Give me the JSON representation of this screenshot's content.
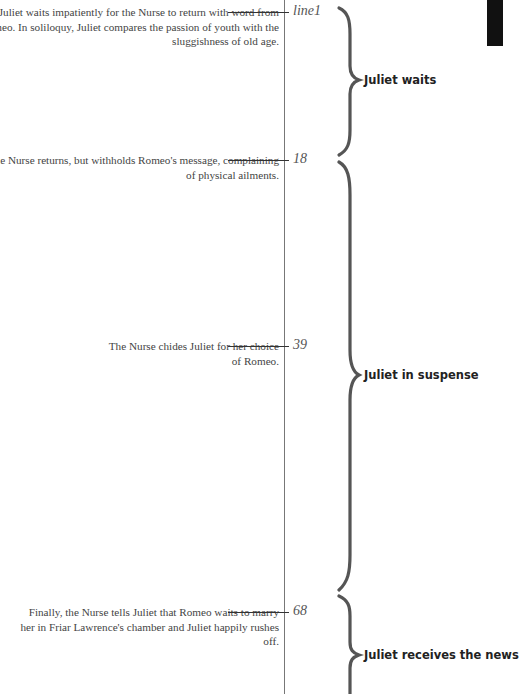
{
  "timeline": {
    "events": [
      {
        "line": "line1",
        "text": "Juliet waits impatiently for the Nurse to return with word from Romeo. In soliloquy, Juliet compares the passion of youth with the sluggishness of old age."
      },
      {
        "line": "18",
        "text": "The Nurse returns, but withholds Romeo's message, complaining of physical ailments."
      },
      {
        "line": "39",
        "text": "The Nurse chides Juliet for her choice of Romeo."
      },
      {
        "line": "68",
        "text": "Finally, the Nurse tells Juliet that Romeo waits to marry her in Friar Lawrence's chamber and Juliet happily rushes off."
      }
    ],
    "sections": [
      {
        "label": "Juliet waits"
      },
      {
        "label": "Juliet in suspense"
      },
      {
        "label": "Juliet receives the news"
      }
    ]
  },
  "colors": {
    "brace": "#555555",
    "text": "#444444",
    "label": "#222222"
  }
}
